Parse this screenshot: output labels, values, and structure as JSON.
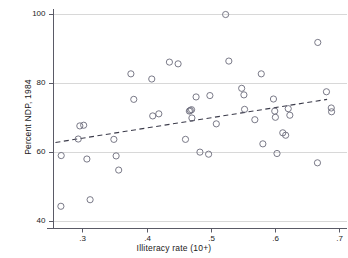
{
  "chart_data": {
    "type": "scatter",
    "title": "",
    "xlabel": "Illiteracy rate (10+)",
    "ylabel": "Percent NDP, 1984",
    "xlim": [
      0.255,
      0.712
    ],
    "ylim": [
      38.0,
      101.5
    ],
    "xticks": [
      0.3,
      0.4,
      0.5,
      0.6,
      0.7
    ],
    "xticklabels": [
      ".3",
      ".4",
      ".5",
      ".6",
      ".7"
    ],
    "yticks": [
      40,
      60,
      80,
      100
    ],
    "yticklabels": [
      "40",
      "60",
      "80",
      "100"
    ],
    "grid": "horizontal",
    "grid_color": "#d8d8d8",
    "legend": null,
    "marker": {
      "shape": "circle-open",
      "edge_color": "#6b6b7a",
      "face_color": "none",
      "size_px": 3.1
    },
    "points": [
      {
        "x": 0.2665,
        "y": 44.3
      },
      {
        "x": 0.267,
        "y": 59.0
      },
      {
        "x": 0.2935,
        "y": 63.8
      },
      {
        "x": 0.296,
        "y": 67.6
      },
      {
        "x": 0.302,
        "y": 67.8
      },
      {
        "x": 0.307,
        "y": 58.0
      },
      {
        "x": 0.312,
        "y": 46.2
      },
      {
        "x": 0.349,
        "y": 63.7
      },
      {
        "x": 0.3525,
        "y": 58.9
      },
      {
        "x": 0.3565,
        "y": 54.8
      },
      {
        "x": 0.3755,
        "y": 82.7
      },
      {
        "x": 0.38,
        "y": 75.3
      },
      {
        "x": 0.408,
        "y": 81.2
      },
      {
        "x": 0.4095,
        "y": 70.5
      },
      {
        "x": 0.419,
        "y": 71.1
      },
      {
        "x": 0.4355,
        "y": 86.1
      },
      {
        "x": 0.449,
        "y": 85.6
      },
      {
        "x": 0.4605,
        "y": 63.7
      },
      {
        "x": 0.4665,
        "y": 71.9
      },
      {
        "x": 0.468,
        "y": 72.1
      },
      {
        "x": 0.47,
        "y": 72.3
      },
      {
        "x": 0.4705,
        "y": 69.9
      },
      {
        "x": 0.477,
        "y": 76.0
      },
      {
        "x": 0.483,
        "y": 60.0
      },
      {
        "x": 0.4965,
        "y": 59.4
      },
      {
        "x": 0.4985,
        "y": 76.4
      },
      {
        "x": 0.5085,
        "y": 68.2
      },
      {
        "x": 0.523,
        "y": 99.9
      },
      {
        "x": 0.528,
        "y": 86.4
      },
      {
        "x": 0.548,
        "y": 78.5
      },
      {
        "x": 0.5515,
        "y": 76.6
      },
      {
        "x": 0.5525,
        "y": 72.4
      },
      {
        "x": 0.5685,
        "y": 69.4
      },
      {
        "x": 0.5785,
        "y": 82.7
      },
      {
        "x": 0.581,
        "y": 62.4
      },
      {
        "x": 0.5975,
        "y": 75.4
      },
      {
        "x": 0.5995,
        "y": 71.9
      },
      {
        "x": 0.6005,
        "y": 70.1
      },
      {
        "x": 0.603,
        "y": 59.6
      },
      {
        "x": 0.612,
        "y": 65.6
      },
      {
        "x": 0.6165,
        "y": 64.9
      },
      {
        "x": 0.6205,
        "y": 72.6
      },
      {
        "x": 0.623,
        "y": 70.7
      },
      {
        "x": 0.666,
        "y": 56.9
      },
      {
        "x": 0.6665,
        "y": 91.8
      },
      {
        "x": 0.68,
        "y": 77.5
      },
      {
        "x": 0.6875,
        "y": 72.8
      },
      {
        "x": 0.688,
        "y": 71.7
      }
    ],
    "fit_line": {
      "style": "dashed",
      "color": "#3b3b4a",
      "x_start": 0.258,
      "y_start": 62.8,
      "x_end": 0.681,
      "y_end": 75.3
    }
  }
}
